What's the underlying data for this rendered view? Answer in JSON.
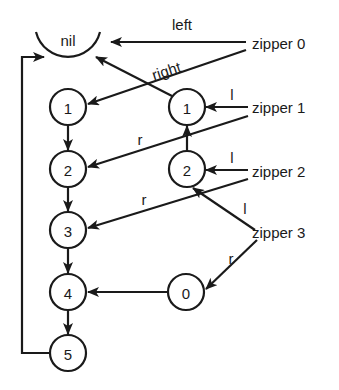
{
  "diagram": {
    "title": "",
    "nil_node": {
      "label": "nil"
    },
    "list_nodes": [
      {
        "id": "n1",
        "label": "1"
      },
      {
        "id": "n2",
        "label": "2"
      },
      {
        "id": "n3",
        "label": "3"
      },
      {
        "id": "n4",
        "label": "4"
      },
      {
        "id": "n5",
        "label": "5"
      }
    ],
    "reversed_nodes": [
      {
        "id": "r1",
        "label": "1"
      },
      {
        "id": "r2",
        "label": "2"
      },
      {
        "id": "r0",
        "label": "0"
      }
    ],
    "zippers": [
      {
        "id": "z0",
        "label": "zipper 0"
      },
      {
        "id": "z1",
        "label": "zipper 1"
      },
      {
        "id": "z2",
        "label": "zipper 2"
      },
      {
        "id": "z3",
        "label": "zipper 3"
      }
    ],
    "edge_labels": {
      "z0_left": "left",
      "z0_right": "right",
      "z1_left": "l",
      "z1_right": "r",
      "z2_left": "l",
      "z2_right": "r",
      "z3_left": "l",
      "z3_right": "r"
    },
    "edges": [
      {
        "from": "zipper 0",
        "to": "nil",
        "label": "left"
      },
      {
        "from": "zipper 0",
        "to": "1 (list)",
        "label": "right"
      },
      {
        "from": "zipper 1",
        "to": "1 (reversed)",
        "label": "l"
      },
      {
        "from": "zipper 1",
        "to": "2 (list)",
        "label": "r"
      },
      {
        "from": "zipper 2",
        "to": "2 (reversed)",
        "label": "l"
      },
      {
        "from": "zipper 2",
        "to": "3 (list)",
        "label": "r"
      },
      {
        "from": "zipper 3",
        "to": "2 (reversed)",
        "label": "l"
      },
      {
        "from": "zipper 3",
        "to": "0 (reversed)",
        "label": "r"
      },
      {
        "from": "1 (list)",
        "to": "2 (list)"
      },
      {
        "from": "2 (list)",
        "to": "3 (list)"
      },
      {
        "from": "3 (list)",
        "to": "4 (list)"
      },
      {
        "from": "4 (list)",
        "to": "5 (list)"
      },
      {
        "from": "5 (list)",
        "to": "nil"
      },
      {
        "from": "1 (reversed)",
        "to": "nil"
      },
      {
        "from": "2 (reversed)",
        "to": "1 (reversed)"
      },
      {
        "from": "0 (reversed)",
        "to": "4 (list)"
      }
    ],
    "colors": {
      "ink": "#1a1a1a",
      "background": "#ffffff"
    }
  }
}
